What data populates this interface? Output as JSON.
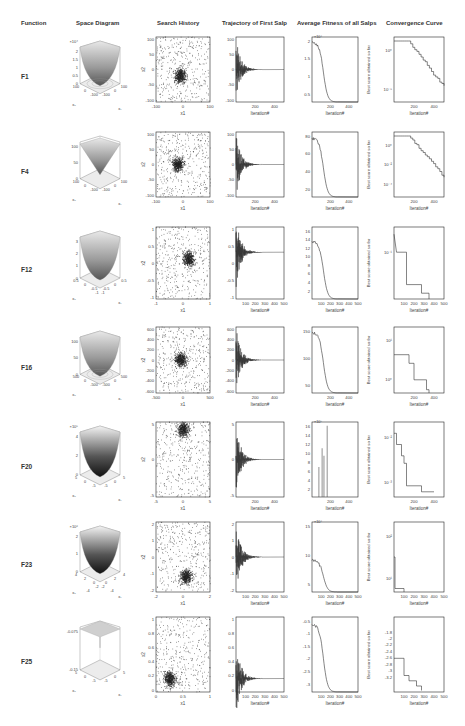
{
  "headers": {
    "function": "Function",
    "space": "Space Diagram",
    "history": "Search History",
    "trajectory": "Trajectory  of First Salp",
    "fitness": "Average Fitness of all Salps",
    "convergence": "Convergence Curve"
  },
  "rows": [
    {
      "fn": "F1",
      "space": {
        "zexp": "×10⁴",
        "zticks": [
          "2",
          "1.5",
          "1",
          "0.5",
          "0"
        ],
        "xticks": [
          "100",
          "0",
          "-100"
        ],
        "yticks": [
          "100",
          "0",
          "-100"
        ]
      },
      "history": {
        "xticks": [
          "-100",
          "0",
          "100"
        ],
        "yticks": [
          "100",
          "50",
          "0",
          "-50",
          "-100"
        ],
        "xlabel": "x1",
        "ylabel": "x2"
      },
      "traj": {
        "yticks": [
          "100",
          "50",
          "0",
          "-50",
          "-100"
        ],
        "xticks": [
          "200",
          "400"
        ],
        "xlabel": "Iteration#"
      },
      "fit": {
        "exp": "×10⁴",
        "yticks": [
          "2",
          "1.5",
          "1",
          "0.5"
        ],
        "xticks": [
          "200",
          "400"
        ],
        "xlabel": "Iteration#"
      },
      "conv": {
        "yticks": [
          "10⁰",
          "10⁻⁵"
        ],
        "xticks": [
          "200",
          "400"
        ],
        "xlabel": "Iteration#",
        "ylabel": "Best score obtained so far"
      }
    },
    {
      "fn": "F4",
      "space": {
        "zexp": "",
        "zticks": [
          "100",
          "50",
          "0"
        ],
        "xticks": [
          "100",
          "0",
          "-100"
        ],
        "yticks": [
          "100",
          "0",
          "-100"
        ]
      },
      "history": {
        "xticks": [
          "-100",
          "0",
          "100"
        ],
        "yticks": [
          "100",
          "50",
          "0",
          "-50",
          "-100"
        ],
        "xlabel": "x1",
        "ylabel": "x2"
      },
      "traj": {
        "yticks": [
          "100",
          "50",
          "0",
          "-50",
          "-100"
        ],
        "xticks": [
          "200",
          "400"
        ],
        "xlabel": "Iteration#"
      },
      "fit": {
        "exp": "",
        "yticks": [
          "80",
          "60",
          "40",
          "20"
        ],
        "xticks": [
          "200",
          "400"
        ],
        "xlabel": "Iteration#"
      },
      "conv": {
        "yticks": [
          "10⁰",
          "10⁻²",
          "10⁻⁴"
        ],
        "xticks": [
          "200",
          "400"
        ],
        "xlabel": "Iteration#",
        "ylabel": "Best score obtained so far"
      }
    },
    {
      "fn": "F12",
      "space": {
        "zexp": "",
        "zticks": [
          "3",
          "2",
          "1",
          "0"
        ],
        "xticks": [
          "0.5",
          "0",
          "-0.5",
          "-1"
        ],
        "yticks": [
          "0.5",
          "0",
          "-0.5",
          "-1"
        ]
      },
      "history": {
        "xticks": [
          "-1",
          "0",
          "1"
        ],
        "yticks": [
          "1",
          "0.5",
          "0",
          "-0.5",
          "-1"
        ],
        "xlabel": "x1",
        "ylabel": "x2"
      },
      "traj": {
        "yticks": [
          "1",
          "0.5",
          "0",
          "-0.5",
          "-1"
        ],
        "xticks": [
          "100",
          "200",
          "300",
          "400",
          "500"
        ],
        "xlabel": "Iteration#"
      },
      "fit": {
        "exp": "",
        "yticks": [
          "16",
          "14",
          "12",
          "10",
          "8",
          "6",
          "4",
          "2"
        ],
        "xticks": [
          "100",
          "200",
          "300",
          "400",
          "500"
        ],
        "xlabel": "Iteration#"
      },
      "conv": {
        "yticks": [
          "10⁻¹"
        ],
        "xticks": [
          "100",
          "200",
          "300",
          "400",
          "500"
        ],
        "xlabel": "Iteration#",
        "ylabel": "Best score obtained so far"
      }
    },
    {
      "fn": "F16",
      "space": {
        "zexp": "",
        "zticks": [
          "100",
          "50",
          "0"
        ],
        "xticks": [
          "500",
          "0",
          "-500"
        ],
        "yticks": [
          "500",
          "0",
          "-500"
        ]
      },
      "history": {
        "xticks": [
          "-500",
          "0",
          "500"
        ],
        "yticks": [
          "600",
          "400",
          "200",
          "0",
          "-200",
          "-400",
          "-600"
        ],
        "xlabel": "x1",
        "ylabel": "x2"
      },
      "traj": {
        "yticks": [
          "600",
          "400",
          "200",
          "0",
          "-200",
          "-400",
          "-600"
        ],
        "xticks": [
          "200",
          "400"
        ],
        "xlabel": "Iteration#"
      },
      "fit": {
        "exp": "",
        "yticks": [
          "150",
          "100",
          "50"
        ],
        "xticks": [
          "200",
          "400"
        ],
        "xlabel": "Iteration#"
      },
      "conv": {
        "yticks": [
          "10¹",
          "10⁰"
        ],
        "xticks": [
          "200",
          "400"
        ],
        "xlabel": "Iteration#",
        "ylabel": "Best score obtained so far"
      }
    },
    {
      "fn": "F20",
      "space": {
        "zexp": "×10⁵",
        "zticks": [
          "4",
          "2",
          "0"
        ],
        "xticks": [
          "5",
          "0",
          "-5"
        ],
        "yticks": [
          "5",
          "0",
          "-5"
        ]
      },
      "history": {
        "xticks": [
          "-5",
          "0",
          "5"
        ],
        "yticks": [
          "5",
          "0",
          "-5"
        ],
        "xlabel": "x1",
        "ylabel": "x2"
      },
      "traj": {
        "yticks": [
          "5",
          "0",
          "-5"
        ],
        "xticks": [
          "200",
          "400"
        ],
        "xlabel": "Iteration#"
      },
      "fit": {
        "exp": "×10⁵",
        "yticks": [
          "16",
          "14",
          "12",
          "10",
          "8",
          "6",
          "4",
          "2"
        ],
        "xticks": [
          "200",
          "400"
        ],
        "xlabel": "Iteration#"
      },
      "conv": {
        "yticks": [
          "10⁻²",
          "10⁻³"
        ],
        "xticks": [
          "200",
          "400"
        ],
        "xlabel": "Iteration#",
        "ylabel": "Best score obtained so far"
      }
    },
    {
      "fn": "F23",
      "space": {
        "zexp": "×10⁶",
        "zticks": [
          "2",
          "1",
          "0"
        ],
        "xticks": [
          "4",
          "2",
          "0",
          "-2",
          "-4"
        ],
        "yticks": [
          "4",
          "2",
          "0",
          "-2",
          "-4"
        ]
      },
      "history": {
        "xticks": [
          "-2",
          "0",
          "2"
        ],
        "yticks": [
          "2",
          "1",
          "0",
          "-1",
          "-2"
        ],
        "xlabel": "x1",
        "ylabel": "x2"
      },
      "traj": {
        "yticks": [
          "2",
          "1",
          "0",
          "-1",
          "-2"
        ],
        "xticks": [
          "100",
          "200",
          "300",
          "400",
          "500"
        ],
        "xlabel": "Iteration#"
      },
      "fit": {
        "exp": "×10⁴",
        "yticks": [
          "15",
          "10",
          "5"
        ],
        "xticks": [
          "100",
          "200",
          "300",
          "400",
          "500"
        ],
        "xlabel": "Iteration#"
      },
      "conv": {
        "yticks": [
          "10²",
          "10¹"
        ],
        "xticks": [
          "100",
          "200",
          "300",
          "400",
          "500"
        ],
        "xlabel": "Iteration#",
        "ylabel": "Best score obtained so far"
      }
    },
    {
      "fn": "F25",
      "space": {
        "zexp": "",
        "zticks": [
          "-0.075",
          "-0.15"
        ],
        "xticks": [
          "5",
          "0",
          "-5"
        ],
        "yticks": [
          "5",
          "0",
          "-5"
        ]
      },
      "history": {
        "xticks": [
          "0",
          "0.5",
          "1"
        ],
        "yticks": [
          "1",
          "0.8",
          "0.6",
          "0.4",
          "0.2",
          "0"
        ],
        "xlabel": "x1",
        "ylabel": "x2"
      },
      "traj": {
        "yticks": [
          "1",
          "0.8",
          "0.6",
          "0.4",
          "0.2",
          "0"
        ],
        "xticks": [
          "100",
          "200",
          "300",
          "400",
          "500"
        ],
        "xlabel": "Iteration#"
      },
      "fit": {
        "exp": "",
        "yticks": [
          "-0.5",
          "-1",
          "-1.5",
          "-2",
          "-2.5",
          "-3"
        ],
        "xticks": [
          "100",
          "200",
          "300",
          "400",
          "500"
        ],
        "xlabel": "Iteration#"
      },
      "conv": {
        "yticks": [
          "-1.8",
          "-2",
          "-2.2",
          "-2.4",
          "-2.6",
          "-2.8",
          "-3",
          "-3.2"
        ],
        "xticks": [
          "100",
          "200",
          "300",
          "400",
          "500"
        ],
        "xlabel": "Iteration#",
        "ylabel": "Best score obtained so far"
      }
    }
  ],
  "chart_data": [
    {
      "type": "line",
      "title": "F1 Convergence Curve",
      "xlabel": "Iteration#",
      "ylabel": "Best score obtained so far",
      "yscale": "log",
      "x": [
        0,
        100,
        150,
        200,
        250,
        300,
        350,
        400,
        450,
        500
      ],
      "values": [
        10,
        9,
        3,
        1,
        0.2,
        0.03,
        0.003,
        0.0003,
        3e-05,
        1e-06
      ]
    },
    {
      "type": "line",
      "title": "F1 Average Fitness of all Salps",
      "xlabel": "Iteration#",
      "x": [
        0,
        25,
        50,
        75,
        100,
        125,
        150,
        175,
        200
      ],
      "values": [
        20000,
        19000,
        17000,
        12000,
        7000,
        3000,
        800,
        100,
        0
      ]
    },
    {
      "type": "line",
      "title": "F4 Average Fitness of all Salps",
      "xlabel": "Iteration#",
      "x": [
        0,
        25,
        50,
        75,
        100,
        150,
        200,
        250
      ],
      "values": [
        80,
        78,
        80,
        70,
        45,
        20,
        5,
        0
      ]
    },
    {
      "type": "line",
      "title": "F12 Average Fitness of all Salps",
      "xlabel": "Iteration#",
      "x": [
        0,
        25,
        50,
        75,
        100,
        125,
        150,
        200
      ],
      "values": [
        14,
        14,
        12,
        9,
        5,
        2,
        0.5,
        0
      ]
    },
    {
      "type": "line",
      "title": "F16 Average Fitness of all Salps",
      "xlabel": "Iteration#",
      "x": [
        0,
        25,
        50,
        75,
        100,
        150,
        200
      ],
      "values": [
        175,
        170,
        140,
        100,
        60,
        15,
        0
      ]
    },
    {
      "type": "line",
      "title": "F23 Average Fitness of all Salps",
      "xlabel": "Iteration#",
      "x": [
        0,
        25,
        50,
        75,
        100,
        150
      ],
      "values": [
        10,
        8,
        6,
        3,
        1,
        0
      ]
    },
    {
      "type": "line",
      "title": "F25 Average Fitness of all Salps",
      "xlabel": "Iteration#",
      "x": [
        0,
        25,
        50,
        75,
        100,
        150,
        200,
        250
      ],
      "values": [
        -0.3,
        -0.6,
        -0.2,
        -0.3,
        -0.9,
        -1.4,
        -2.6,
        -3.3
      ]
    },
    {
      "type": "line",
      "title": "F25 Convergence Curve",
      "xlabel": "Iteration#",
      "ylabel": "Best score obtained so far",
      "x": [
        0,
        100,
        110,
        150,
        200,
        250,
        300
      ],
      "values": [
        -2.5,
        -2.5,
        -3.0,
        -3.1,
        -3.2,
        -3.25,
        -3.25
      ]
    }
  ]
}
